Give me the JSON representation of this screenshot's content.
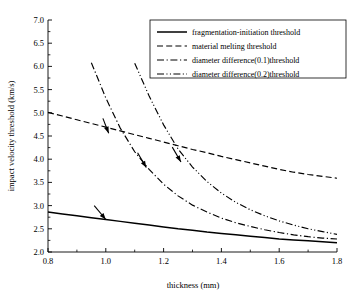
{
  "chart_data": {
    "type": "line",
    "title": "",
    "xlabel": "thickness (mm)",
    "ylabel": "impact velocity threshold (km/s)",
    "xlim": [
      0.8,
      1.8
    ],
    "ylim": [
      2.0,
      7.0
    ],
    "xticks": [
      "0.8",
      "1.0",
      "1.2",
      "1.4",
      "1.6",
      "1.8"
    ],
    "xtick_values": [
      0.8,
      1.0,
      1.2,
      1.4,
      1.6,
      1.8
    ],
    "yticks": [
      "2.0",
      "2.5",
      "3.0",
      "3.5",
      "4.0",
      "4.5",
      "5.0",
      "5.5",
      "6.0",
      "6.5",
      "7.0"
    ],
    "ytick_values": [
      2.0,
      2.5,
      3.0,
      3.5,
      4.0,
      4.5,
      5.0,
      5.5,
      6.0,
      6.5,
      7.0
    ],
    "grid": false,
    "legend_position": "top-right",
    "series": [
      {
        "name": "fragmentation-initiation threshold",
        "style": "solid",
        "x": [
          0.8,
          0.85,
          0.9,
          0.95,
          1.0,
          1.05,
          1.1,
          1.15,
          1.2,
          1.25,
          1.3,
          1.35,
          1.4,
          1.45,
          1.5,
          1.55,
          1.6,
          1.65,
          1.7,
          1.75,
          1.8
        ],
        "y": [
          2.86,
          2.82,
          2.78,
          2.74,
          2.7,
          2.66,
          2.62,
          2.58,
          2.54,
          2.5,
          2.47,
          2.43,
          2.4,
          2.37,
          2.34,
          2.31,
          2.28,
          2.26,
          2.24,
          2.22,
          2.2
        ]
      },
      {
        "name": "material melting threshold",
        "style": "dashed",
        "x": [
          0.8,
          0.85,
          0.9,
          0.95,
          1.0,
          1.05,
          1.1,
          1.15,
          1.2,
          1.25,
          1.3,
          1.35,
          1.4,
          1.45,
          1.5,
          1.55,
          1.6,
          1.65,
          1.7,
          1.75,
          1.8
        ],
        "y": [
          5.01,
          4.93,
          4.85,
          4.77,
          4.69,
          4.61,
          4.53,
          4.45,
          4.37,
          4.29,
          4.21,
          4.14,
          4.06,
          3.99,
          3.92,
          3.85,
          3.78,
          3.72,
          3.67,
          3.63,
          3.59
        ]
      },
      {
        "name": "diameter difference(0.1)threshold",
        "style": "dash-dot",
        "x": [
          0.95,
          1.0,
          1.05,
          1.1,
          1.15,
          1.2,
          1.25,
          1.3,
          1.35,
          1.4,
          1.45,
          1.5,
          1.55,
          1.6,
          1.65,
          1.7,
          1.75,
          1.8
        ],
        "y": [
          6.08,
          5.32,
          4.67,
          4.16,
          3.78,
          3.46,
          3.21,
          3.01,
          2.86,
          2.73,
          2.63,
          2.55,
          2.48,
          2.42,
          2.37,
          2.33,
          2.3,
          2.28
        ]
      },
      {
        "name": "diameter difference(0.2)threshold",
        "style": "dash-dot-dot",
        "x": [
          1.1,
          1.15,
          1.2,
          1.25,
          1.3,
          1.35,
          1.4,
          1.45,
          1.5,
          1.55,
          1.6,
          1.65,
          1.7,
          1.75,
          1.8
        ],
        "y": [
          6.07,
          5.36,
          4.74,
          4.22,
          3.83,
          3.52,
          3.27,
          3.07,
          2.91,
          2.78,
          2.67,
          2.58,
          2.5,
          2.44,
          2.38
        ]
      }
    ],
    "annotations": [
      {
        "name": "arrow-to-fragmentation-curve",
        "x": 1.0,
        "y": 2.7,
        "dx": -0.04,
        "dy": 0.3
      },
      {
        "name": "arrow-to-melting-curve",
        "x": 1.01,
        "y": 4.56,
        "dx": -0.02,
        "dy": 0.32
      },
      {
        "name": "arrow-to-diameter01-curve",
        "x": 1.14,
        "y": 3.82,
        "dx": -0.03,
        "dy": 0.32
      },
      {
        "name": "arrow-to-diameter02-curve",
        "x": 1.26,
        "y": 3.94,
        "dx": -0.03,
        "dy": 0.32
      }
    ]
  },
  "legend": {
    "items": [
      {
        "label": "fragmentation-initiation threshold",
        "style": "solid"
      },
      {
        "label": "material melting threshold",
        "style": "dashed"
      },
      {
        "label": "diameter difference(0.1)threshold",
        "style": "dash-dot"
      },
      {
        "label": "diameter difference(0.2)threshold",
        "style": "dash-dot-dot"
      }
    ]
  },
  "colors": {
    "line": "#000000",
    "axis": "#000000",
    "background": "#ffffff"
  }
}
